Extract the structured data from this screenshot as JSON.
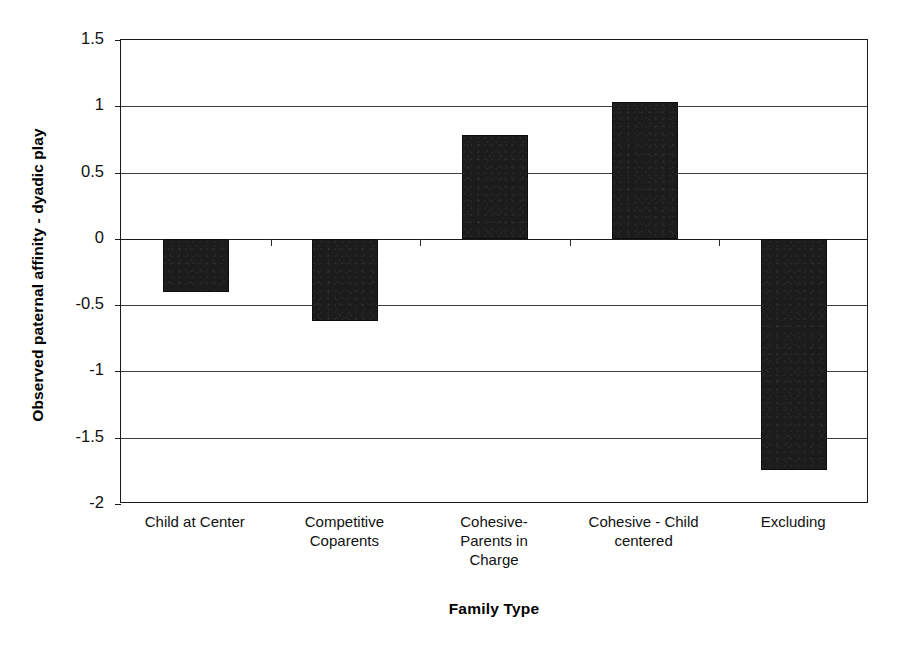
{
  "chart_data": {
    "type": "bar",
    "title": "",
    "xlabel": "Family Type",
    "ylabel": "Observed paternal affinity - dyadic play",
    "categories": [
      "Child at Center",
      "Competitive Coparents",
      "Cohesive- Parents in Charge",
      "Cohesive - Child centered",
      "Excluding"
    ],
    "category_lines": [
      [
        "Child at Center"
      ],
      [
        "Competitive",
        "Coparents"
      ],
      [
        "Cohesive-",
        "Parents in",
        "Charge"
      ],
      [
        "Cohesive - Child",
        "centered"
      ],
      [
        "Excluding"
      ]
    ],
    "values": [
      -0.4,
      -0.62,
      0.78,
      1.03,
      -1.74
    ],
    "ylim": [
      -2,
      1.5
    ],
    "ytick_labels": [
      "1.5",
      "1",
      "0.5",
      "0",
      "-0.5",
      "-1",
      "-1.5",
      "-2"
    ],
    "ytick_values": [
      1.5,
      1,
      0.5,
      0,
      -0.5,
      -1,
      -1.5,
      -2
    ],
    "grid": true,
    "legend": "none",
    "bar_color": "#1c1c1c",
    "axis_color": "#1a1a1a"
  }
}
